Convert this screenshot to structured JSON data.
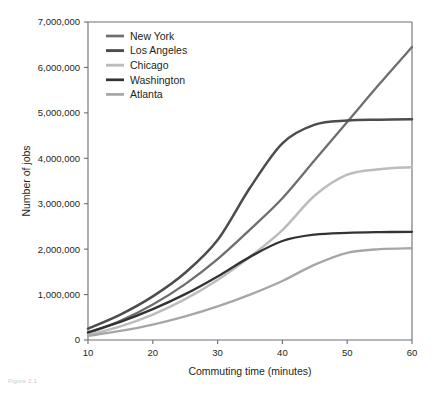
{
  "figure": {
    "caption_fragment": "Figure 2.1"
  },
  "chart_data": {
    "type": "line",
    "title": "",
    "xlabel": "Commuting time (minutes)",
    "ylabel": "Number of jobs",
    "xlim": [
      10,
      60
    ],
    "ylim": [
      0,
      7000000
    ],
    "xticks": [
      10,
      20,
      30,
      40,
      50,
      60
    ],
    "xtick_labels": [
      "10",
      "20",
      "30",
      "40",
      "50",
      "60"
    ],
    "yticks": [
      0,
      1000000,
      2000000,
      3000000,
      4000000,
      5000000,
      6000000,
      7000000
    ],
    "ytick_labels": [
      "0",
      "1,000,000",
      "2,000,000",
      "3,000,000",
      "4,000,000",
      "5,000,000",
      "6,000,000",
      "7,000,000"
    ],
    "grid": false,
    "legend_position": "top-left",
    "x": [
      10,
      15,
      20,
      25,
      30,
      35,
      40,
      45,
      50,
      55,
      60
    ],
    "series": [
      {
        "name": "New York",
        "color": "#6e6e6e",
        "width": 2.3,
        "values": [
          150000,
          420000,
          780000,
          1230000,
          1780000,
          2430000,
          3120000,
          3960000,
          4800000,
          5640000,
          6450000
        ]
      },
      {
        "name": "Los Angeles",
        "color": "#4c4c4c",
        "width": 2.5,
        "values": [
          250000,
          560000,
          960000,
          1480000,
          2200000,
          3350000,
          4330000,
          4740000,
          4830000,
          4850000,
          4860000
        ]
      },
      {
        "name": "Chicago",
        "color": "#bcbcbc",
        "width": 2.5,
        "values": [
          110000,
          300000,
          560000,
          900000,
          1320000,
          1830000,
          2420000,
          3180000,
          3640000,
          3760000,
          3800000
        ]
      },
      {
        "name": "Washington",
        "color": "#333333",
        "width": 2.3,
        "values": [
          170000,
          400000,
          680000,
          1010000,
          1400000,
          1830000,
          2180000,
          2320000,
          2360000,
          2375000,
          2380000
        ]
      },
      {
        "name": "Atlanta",
        "color": "#a6a6a6",
        "width": 2.3,
        "values": [
          90000,
          200000,
          340000,
          520000,
          740000,
          1000000,
          1300000,
          1660000,
          1920000,
          2000000,
          2020000
        ]
      }
    ]
  }
}
